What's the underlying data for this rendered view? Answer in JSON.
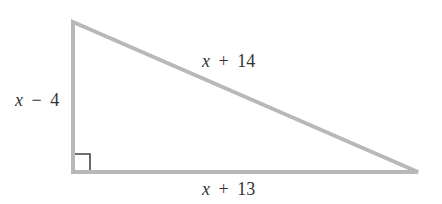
{
  "diagram": {
    "type": "right-triangle",
    "stroke_color": "#b8b8b8",
    "marker_color": "#444444",
    "vertices": {
      "top": [
        73,
        22
      ],
      "right_angle": [
        73,
        172
      ],
      "right": [
        418,
        172
      ]
    },
    "right_angle_marker": true,
    "sides": {
      "vertical_leg": {
        "variable": "x",
        "operator": "−",
        "constant": "4",
        "text": "x − 4"
      },
      "hypotenuse": {
        "variable": "x",
        "operator": "+",
        "constant": "14",
        "text": "x + 14"
      },
      "horizontal_leg": {
        "variable": "x",
        "operator": "+",
        "constant": "13",
        "text": "x + 13"
      }
    }
  }
}
